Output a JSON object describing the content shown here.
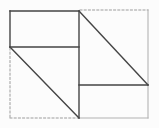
{
  "figure": {
    "kind": "geometric-line-diagram",
    "canvas": {
      "width": 159,
      "height": 128,
      "background": "#fcfcfc"
    },
    "colors": {
      "solid": "#454545",
      "light": "#b2b2b2",
      "dashed": "#9c9c9c"
    },
    "stroke_widths": {
      "solid": 1.4,
      "light": 1.1,
      "dashed": 1.0
    },
    "dash_pattern": "2 2.2",
    "segments": [
      {
        "name": "outer-top-dashed-edge",
        "style": "dashed",
        "x1": 80,
        "y1": 10,
        "x2": 148,
        "y2": 10
      },
      {
        "name": "outer-left-dashed-edge",
        "style": "dashed",
        "x1": 10,
        "y1": 48,
        "x2": 10,
        "y2": 118
      },
      {
        "name": "outer-bottom-dashed-edge",
        "style": "dashed",
        "x1": 10,
        "y1": 118,
        "x2": 78,
        "y2": 118
      },
      {
        "name": "outer-right-edge",
        "style": "light",
        "x1": 148,
        "y1": 10,
        "x2": 148,
        "y2": 118
      },
      {
        "name": "bottom-right-rect-bottom",
        "style": "light",
        "x1": 79,
        "y1": 118,
        "x2": 148,
        "y2": 118
      },
      {
        "name": "top-left-rect-top",
        "style": "solid",
        "x1": 10,
        "y1": 11,
        "x2": 79,
        "y2": 11
      },
      {
        "name": "top-left-rect-left",
        "style": "solid",
        "x1": 10,
        "y1": 11,
        "x2": 10,
        "y2": 47
      },
      {
        "name": "top-left-rect-bottom",
        "style": "solid",
        "x1": 10,
        "y1": 47,
        "x2": 79,
        "y2": 47
      },
      {
        "name": "center-vertical-line",
        "style": "solid",
        "x1": 79,
        "y1": 11,
        "x2": 79,
        "y2": 118
      },
      {
        "name": "bottom-right-rect-top",
        "style": "solid",
        "x1": 79,
        "y1": 85,
        "x2": 148,
        "y2": 85
      },
      {
        "name": "top-right-diagonal",
        "style": "solid",
        "x1": 79,
        "y1": 11,
        "x2": 148,
        "y2": 85
      },
      {
        "name": "bottom-left-diagonal",
        "style": "solid",
        "x1": 10,
        "y1": 47,
        "x2": 79,
        "y2": 118
      }
    ]
  }
}
